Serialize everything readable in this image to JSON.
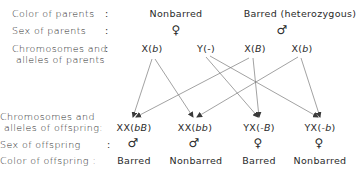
{
  "rows": {
    "color_of_parents": {
      "label": "Color of parents",
      "colon": ":",
      "female": "Nonbarred",
      "male": "Barred (heterozygous)"
    },
    "sex_of_parents": {
      "label": "Sex of parents",
      "colon": ":",
      "female_symbol": "♀",
      "male_symbol": "♂"
    },
    "parent_chromosomes": {
      "label_line1": "Chromosomes and",
      "label_line2": "alleles of parents",
      "colon": ":",
      "items": [
        {
          "chrom": "X(",
          "allele": "b",
          "close": ")"
        },
        {
          "chrom": "Y(",
          "allele": "-",
          "close": ")"
        },
        {
          "chrom": "X(",
          "allele": "B",
          "close": ")"
        },
        {
          "chrom": "X(",
          "allele": "b",
          "close": ")"
        }
      ]
    },
    "offspring_chromosomes": {
      "label_line1": "Chromosomes  and",
      "label_line2": "alleles of offspring",
      "colon": ":",
      "items": [
        {
          "chrom": "XX(",
          "allele": "bB",
          "close": ")"
        },
        {
          "chrom": "XX(",
          "allele": "bb",
          "close": ")"
        },
        {
          "chrom": "YX(",
          "allele": "-B",
          "close": ")"
        },
        {
          "chrom": "YX(",
          "allele": "-b",
          "close": ")"
        }
      ]
    },
    "sex_of_offspring": {
      "label": "Sex of offspring",
      "colon": ":",
      "symbols": [
        "♂",
        "♂",
        "♀",
        "♀"
      ]
    },
    "color_of_offspring": {
      "label": "Color of offspring",
      "colon": ":",
      "values": [
        "Barred",
        "Nonbarred",
        "Barred",
        "Nonbarred"
      ]
    }
  },
  "arrows": [
    {
      "from": "parent-0",
      "to": "offspring-0"
    },
    {
      "from": "parent-0",
      "to": "offspring-1"
    },
    {
      "from": "parent-1",
      "to": "offspring-2"
    },
    {
      "from": "parent-1",
      "to": "offspring-3"
    },
    {
      "from": "parent-2",
      "to": "offspring-0"
    },
    {
      "from": "parent-2",
      "to": "offspring-2"
    },
    {
      "from": "parent-3",
      "to": "offspring-1"
    },
    {
      "from": "parent-3",
      "to": "offspring-3"
    }
  ],
  "colors": {
    "text": "#2a2a2a",
    "arrow": "#6a6a6a"
  }
}
